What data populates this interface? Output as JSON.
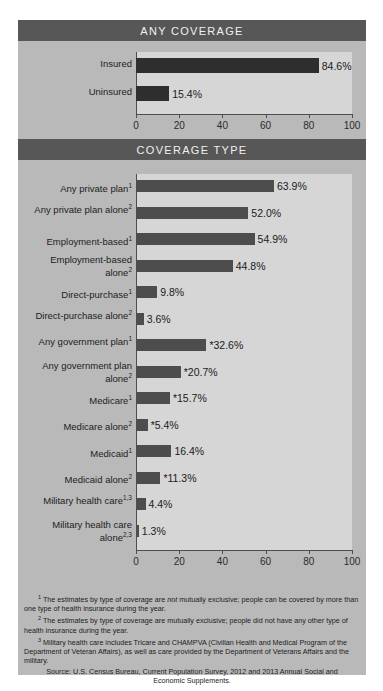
{
  "chart_data": [
    {
      "type": "bar",
      "title": "ANY COVERAGE",
      "orientation": "horizontal",
      "categories": [
        "Insured",
        "Uninsured"
      ],
      "values": [
        84.6,
        15.4
      ],
      "labels": [
        "84.6%",
        "15.4%"
      ],
      "xlabel": "",
      "ylabel": "",
      "xlim": [
        0,
        100
      ],
      "xticks": [
        0,
        20,
        40,
        60,
        80,
        100
      ],
      "grid": false,
      "legend": "none"
    },
    {
      "type": "bar",
      "title": "COVERAGE TYPE",
      "orientation": "horizontal",
      "categories": [
        "Any private plan",
        "Any private plan alone",
        "Employment-based",
        "Employment-based alone",
        "Direct-purchase",
        "Direct-purchase alone",
        "Any government plan",
        "Any government plan alone",
        "Medicare",
        "Medicare alone",
        "Medicaid",
        "Medicaid alone",
        "Military health care",
        "Military health care alone"
      ],
      "category_footnotes": [
        "1",
        "2",
        "1",
        "2",
        "1",
        "2",
        "1",
        "2",
        "1",
        "2",
        "1",
        "2",
        "1,3",
        "2,3"
      ],
      "values": [
        63.9,
        52.0,
        54.9,
        44.8,
        9.8,
        3.6,
        32.6,
        20.7,
        15.7,
        5.4,
        16.4,
        11.3,
        4.4,
        1.3
      ],
      "labels": [
        "63.9%",
        "52.0%",
        "54.9%",
        "44.8%",
        "9.8%",
        "3.6%",
        "*32.6%",
        "*20.7%",
        "*15.7%",
        "*5.4%",
        "16.4%",
        "*11.3%",
        "4.4%",
        "1.3%"
      ],
      "xlabel": "",
      "ylabel": "",
      "xlim": [
        0,
        100
      ],
      "xticks": [
        0,
        20,
        40,
        60,
        80,
        100
      ],
      "grid": false,
      "legend": "none"
    }
  ],
  "footnotes": [
    {
      "marker": "1",
      "text_before": "The estimates by type of coverage are ",
      "emphasis": "not",
      "text_after": " mutually exclusive; people can be covered by more than one type of health insurance during the year."
    },
    {
      "marker": "2",
      "text_before": "The estimates by type of coverage are mutually exclusive; people did not have any other type of health insurance during the year.",
      "emphasis": "",
      "text_after": ""
    },
    {
      "marker": "3",
      "text_before": "Military health care includes Tricare and CHAMPVA (Civilian Health and Medical Program of the Department of Veteran Affairs), as well as care provided by the Department of Veterans Affairs and the military.",
      "emphasis": "",
      "text_after": ""
    }
  ],
  "source": "Source: U.S. Census Bureau, Current Population Survey, 2012 and 2013 Annual Social and Economic Supplements."
}
